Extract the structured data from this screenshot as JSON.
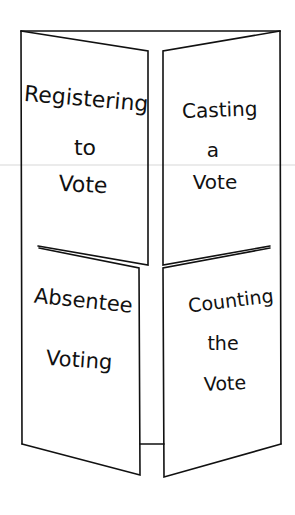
{
  "diagram": {
    "type": "four-panel folded brochure / flip booklet",
    "stroke_color": "#111111",
    "background": "#ffffff",
    "panels": [
      {
        "id": "upper-left",
        "lines": [
          "Registering",
          "to",
          "Vote"
        ]
      },
      {
        "id": "upper-right",
        "lines": [
          "Casting",
          "a",
          "Vote"
        ]
      },
      {
        "id": "lower-left",
        "lines": [
          "Absentee",
          "Voting"
        ]
      },
      {
        "id": "lower-right",
        "lines": [
          "Counting",
          "the",
          "Vote"
        ]
      }
    ]
  }
}
